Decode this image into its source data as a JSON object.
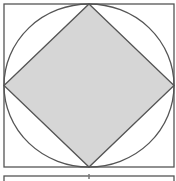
{
  "diagram": {
    "colors": {
      "stroke": "#555555",
      "fill_shaded": "#d6d6d6",
      "background": "#ffffff"
    },
    "outer_square": {
      "x": 4,
      "y": 4,
      "width": 170,
      "height": 163
    },
    "circle": {
      "cx": 89,
      "cy": 85.5,
      "rx": 85,
      "ry": 81.5
    },
    "diamond": {
      "top": [
        89,
        4
      ],
      "right": [
        174,
        85.5
      ],
      "bottom": [
        89,
        167
      ],
      "left": [
        4,
        85.5
      ]
    },
    "lower_box": {
      "x": 4,
      "y": 176,
      "width": 170,
      "height": 10
    },
    "lower_tick": {
      "x": 89,
      "y1": 174,
      "y2": 179
    }
  }
}
